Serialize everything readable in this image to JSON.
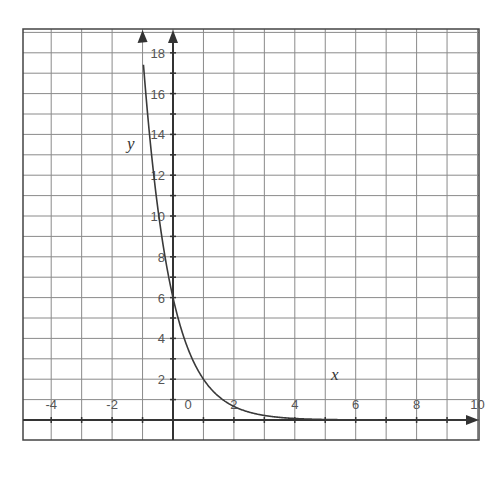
{
  "chart_data": {
    "type": "line",
    "title": "",
    "function": "y = 6 * (1/3)^x",
    "xlabel": "x",
    "ylabel": "y",
    "xlim": [
      -5,
      10
    ],
    "ylim": [
      -1,
      19
    ],
    "grid": true,
    "x_ticks": [
      -4,
      -2,
      0,
      2,
      4,
      6,
      8,
      10
    ],
    "x_tick_labels": [
      "-4",
      "-2",
      "0",
      "2",
      "4",
      "6",
      "8",
      "10"
    ],
    "y_ticks": [
      2,
      4,
      6,
      8,
      10,
      12,
      14,
      16,
      18
    ],
    "y_tick_labels": [
      "2",
      "4",
      "6",
      "8",
      "10",
      "12",
      "14",
      "16",
      "18"
    ],
    "series": [
      {
        "name": "exponential decay",
        "x": [
          -1,
          -0.75,
          -0.5,
          -0.25,
          0,
          0.5,
          1,
          1.5,
          2,
          3,
          4,
          5,
          6
        ],
        "y": [
          18,
          13.68,
          10.39,
          7.9,
          6,
          3.46,
          2,
          1.15,
          0.67,
          0.22,
          0.07,
          0.02,
          0.01
        ]
      }
    ]
  },
  "labels": {
    "x_axis": "x",
    "y_axis": "y",
    "origin": "0"
  },
  "colors": {
    "grid": "#8a8a8a",
    "axis": "#333333",
    "curve": "#3a3a3a",
    "text": "#555555"
  }
}
